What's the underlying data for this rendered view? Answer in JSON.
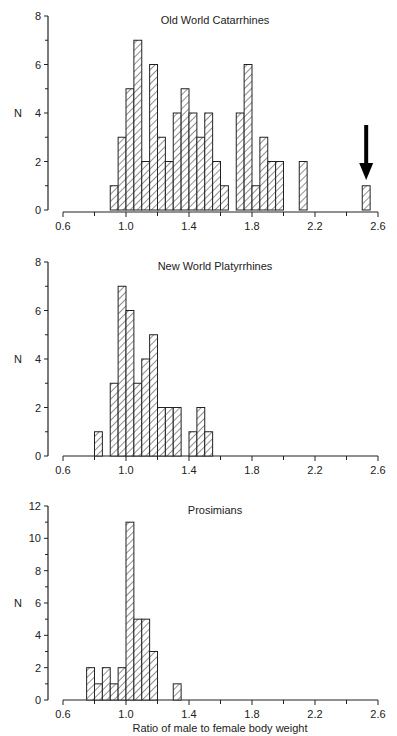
{
  "chart_data": [
    {
      "type": "bar",
      "title": "Old World Catarrhines",
      "xlabel": "",
      "ylabel": "N",
      "xlim": [
        0.6,
        2.6
      ],
      "ylim": [
        0,
        8
      ],
      "xticks": [
        "0.6",
        "1.0",
        "1.4",
        "1.8",
        "2.2",
        "2.6"
      ],
      "yticks": [
        "0",
        "2",
        "4",
        "6",
        "8"
      ],
      "bin_width": 0.05,
      "bins_start": [
        0.9,
        0.95,
        1.0,
        1.05,
        1.1,
        1.15,
        1.2,
        1.25,
        1.3,
        1.35,
        1.4,
        1.45,
        1.5,
        1.55,
        1.6,
        1.7,
        1.75,
        1.8,
        1.85,
        1.9,
        1.95,
        2.1,
        2.5
      ],
      "values": [
        1,
        3,
        5,
        7,
        2,
        6,
        3,
        2,
        4,
        5,
        4,
        3,
        4,
        2,
        1,
        4,
        6,
        1,
        3,
        2,
        2,
        2,
        1
      ],
      "annotation": "arrow pointing to bar at 2.50",
      "grid": false
    },
    {
      "type": "bar",
      "title": "New World Platyrrhines",
      "xlabel": "",
      "ylabel": "N",
      "xlim": [
        0.6,
        2.6
      ],
      "ylim": [
        0,
        8
      ],
      "xticks": [
        "0.6",
        "1.0",
        "1.4",
        "1.8",
        "2.2",
        "2.6"
      ],
      "yticks": [
        "0",
        "2",
        "4",
        "6",
        "8"
      ],
      "bin_width": 0.05,
      "bins_start": [
        0.8,
        0.9,
        0.95,
        1.0,
        1.05,
        1.1,
        1.15,
        1.2,
        1.25,
        1.3,
        1.4,
        1.45,
        1.5
      ],
      "values": [
        1,
        3,
        7,
        6,
        3,
        4,
        5,
        2,
        2,
        2,
        1,
        2,
        1
      ],
      "grid": false
    },
    {
      "type": "bar",
      "title": "Prosimians",
      "xlabel": "Ratio of male to female body weight",
      "ylabel": "N",
      "xlim": [
        0.6,
        2.6
      ],
      "ylim": [
        0,
        12
      ],
      "xticks": [
        "0.6",
        "1.0",
        "1.4",
        "1.8",
        "2.2",
        "2.6"
      ],
      "yticks": [
        "0",
        "2",
        "4",
        "6",
        "8",
        "10",
        "12"
      ],
      "bin_width": 0.05,
      "bins_start": [
        0.75,
        0.8,
        0.85,
        0.9,
        0.95,
        1.0,
        1.05,
        1.1,
        1.15,
        1.3
      ],
      "values": [
        2,
        1,
        2,
        1,
        2,
        11,
        5,
        5,
        3,
        1
      ],
      "grid": false
    }
  ]
}
